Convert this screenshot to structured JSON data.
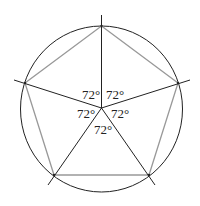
{
  "diagram": {
    "type": "regular-pentagon-inscribed-in-circle",
    "angle_labels": [
      "72°",
      "72°",
      "72°",
      "72°",
      "72°"
    ],
    "colors": {
      "circle": "#222222",
      "radii": "#222222",
      "pentagon_edges": "#999999"
    }
  }
}
